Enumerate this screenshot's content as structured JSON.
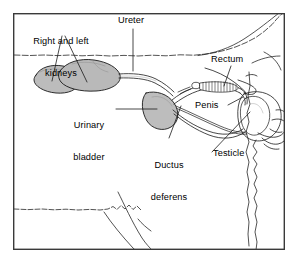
{
  "figure": {
    "type": "anatomical-line-diagram",
    "background_color": "#ffffff",
    "line_color": "#1a1a1a",
    "organ_fill_color": "#b9b9b9",
    "frame": {
      "x": 13,
      "y": 13,
      "width": 272,
      "height": 237,
      "border_color": "#3a3a3a",
      "border_width": 1.4
    },
    "labels": [
      {
        "id": "kidneys",
        "text": "Right and left\nkidneys",
        "line1": "Right and left",
        "line2": "kidneys",
        "x": 18,
        "y": 16,
        "align": "center",
        "width": 86
      },
      {
        "id": "ureter",
        "text": "Ureter",
        "x": 118,
        "y": 16,
        "align": "left",
        "width": 44
      },
      {
        "id": "rectum",
        "text": "Rectum",
        "x": 211,
        "y": 55,
        "align": "left",
        "width": 44
      },
      {
        "id": "urinary-bladder",
        "text": "Urinary\nbladder",
        "line1": "Urinary",
        "line2": "bladder",
        "x": 64,
        "y": 100,
        "align": "center",
        "width": 52
      },
      {
        "id": "penis",
        "text": "Penis",
        "x": 196,
        "y": 100,
        "align": "left",
        "width": 34
      },
      {
        "id": "ductus-deferens",
        "text": "Ductus\ndeferens",
        "line1": "Ductus",
        "line2": "deferens",
        "x": 140,
        "y": 140,
        "align": "center",
        "width": 58
      },
      {
        "id": "testicle",
        "text": "Testicle",
        "x": 213,
        "y": 151,
        "align": "left",
        "width": 46
      }
    ],
    "leader_lines": [
      {
        "id": "leader-kidney-right",
        "from": [
          63,
          36
        ],
        "to": [
          52,
          80
        ]
      },
      {
        "id": "leader-kidney-left",
        "from": [
          66,
          36
        ],
        "to": [
          86,
          81
        ]
      },
      {
        "id": "leader-ureter",
        "from": [
          133,
          28
        ],
        "to": [
          133,
          70
        ]
      },
      {
        "id": "leader-rectum",
        "from": [
          231,
          66
        ],
        "to": [
          224,
          86
        ]
      },
      {
        "id": "leader-bladder",
        "from": [
          117,
          110
        ],
        "to": [
          157,
          110
        ]
      },
      {
        "id": "leader-penis",
        "from": [
          231,
          105
        ],
        "to": [
          245,
          98
        ]
      },
      {
        "id": "leader-ductus",
        "from": [
          170,
          138
        ],
        "to": [
          180,
          105
        ]
      },
      {
        "id": "leader-testicle",
        "from": [
          212,
          152
        ],
        "to": [
          247,
          120
        ]
      }
    ],
    "organs": [
      {
        "id": "right-kidney",
        "name": "Right kidney",
        "shape": "bean",
        "filled": true
      },
      {
        "id": "left-kidney",
        "name": "Left kidney",
        "shape": "bean",
        "filled": true
      },
      {
        "id": "ureter",
        "name": "Ureter",
        "shape": "tube",
        "filled": false
      },
      {
        "id": "urinary-bladder",
        "name": "Urinary bladder",
        "shape": "ovoid",
        "filled": true
      },
      {
        "id": "ductus-deferens",
        "name": "Ductus deferens",
        "shape": "tube",
        "filled": false
      },
      {
        "id": "sigmoid-flexure",
        "name": "Sigmoid flexure / urethra hatching",
        "shape": "hatched-tube",
        "filled": false
      },
      {
        "id": "penis",
        "name": "Penis",
        "shape": "tube",
        "filled": false
      },
      {
        "id": "testicle",
        "name": "Testicle",
        "shape": "ovoid",
        "filled": false
      },
      {
        "id": "rectum",
        "name": "Rectum",
        "shape": "tube",
        "filled": false
      },
      {
        "id": "body-outline",
        "name": "Body wall / hindquarter outline",
        "shape": "contour",
        "filled": false
      }
    ]
  }
}
